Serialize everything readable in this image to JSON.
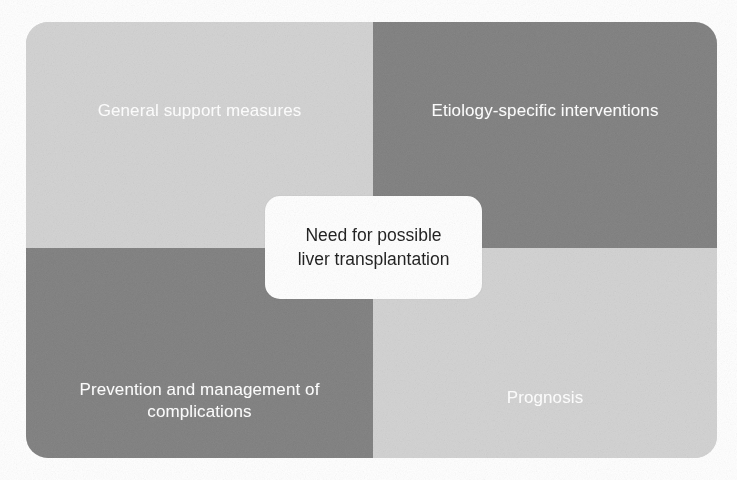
{
  "diagram": {
    "type": "quadrant-matrix",
    "shape": "rounded-rectangle",
    "background_color": "#ffffff",
    "quadrants": [
      {
        "position": "top-left",
        "label": "General support measures",
        "fill_color": "#d2d2d2",
        "text_color": "#ffffff"
      },
      {
        "position": "top-right",
        "label": "Etiology-specific interventions",
        "fill_color": "#808080",
        "text_color": "#ffffff"
      },
      {
        "position": "bottom-left",
        "label": "Prevention and management of\ncomplications",
        "fill_color": "#808080",
        "text_color": "#ffffff"
      },
      {
        "position": "bottom-right",
        "label": "Prognosis",
        "fill_color": "#d2d2d2",
        "text_color": "#ffffff"
      }
    ],
    "center": {
      "label": "Need for possible\nliver transplantation",
      "fill_color": "#ffffff",
      "text_color": "#1b1b1b"
    }
  }
}
